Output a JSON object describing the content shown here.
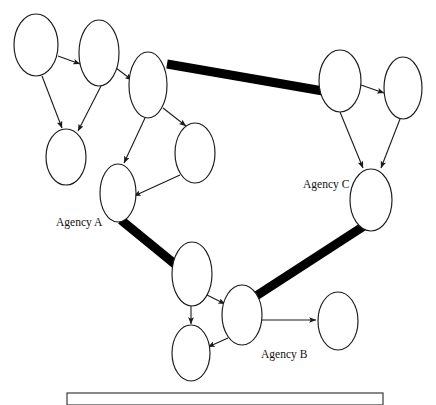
{
  "diagram": {
    "canvas": {
      "width": 436,
      "height": 405,
      "background": "#ffffff"
    },
    "style": {
      "node_fill": "#ffffff",
      "node_stroke": "#1a1a1a",
      "thin_edge_color": "#1a1a1a",
      "thick_edge_color": "#000000",
      "thick_edge_width": 9,
      "thin_edge_width": 1.1,
      "frame_stroke": "#3a3a3a"
    },
    "labels": [
      {
        "id": "label-agency-a",
        "text": "Agency A",
        "x": 56,
        "y": 226
      },
      {
        "id": "label-agency-b",
        "text": "Agency B",
        "x": 261,
        "y": 358
      },
      {
        "id": "label-agency-c",
        "text": "Agency C",
        "x": 303,
        "y": 188
      }
    ],
    "nodes": [
      {
        "id": "n1",
        "name": "node-top-left",
        "cx": 36,
        "cy": 45,
        "rx": 22,
        "ry": 31
      },
      {
        "id": "n2",
        "name": "node-top-second",
        "cx": 99,
        "cy": 53,
        "rx": 20,
        "ry": 33
      },
      {
        "id": "n3",
        "name": "node-top-third",
        "cx": 148,
        "cy": 85,
        "rx": 19,
        "ry": 33
      },
      {
        "id": "n4",
        "name": "node-left-lower",
        "cx": 66,
        "cy": 157,
        "rx": 20,
        "ry": 28
      },
      {
        "id": "n5",
        "name": "node-agency-a",
        "cx": 118,
        "cy": 193,
        "rx": 18,
        "ry": 29
      },
      {
        "id": "n6",
        "name": "node-mid-right",
        "cx": 195,
        "cy": 153,
        "rx": 20,
        "ry": 30
      },
      {
        "id": "n7",
        "name": "node-right-upper",
        "cx": 340,
        "cy": 81,
        "rx": 21,
        "ry": 31
      },
      {
        "id": "n8",
        "name": "node-right-top-far",
        "cx": 403,
        "cy": 88,
        "rx": 19,
        "ry": 31
      },
      {
        "id": "n9",
        "name": "node-agency-c",
        "cx": 371,
        "cy": 200,
        "rx": 21,
        "ry": 31
      },
      {
        "id": "n10",
        "name": "node-lower-mid-upper",
        "cx": 192,
        "cy": 274,
        "rx": 20,
        "ry": 32
      },
      {
        "id": "n11",
        "name": "node-agency-b",
        "cx": 242,
        "cy": 315,
        "rx": 20,
        "ry": 30
      },
      {
        "id": "n12",
        "name": "node-lower-left",
        "cx": 191,
        "cy": 353,
        "rx": 19,
        "ry": 28
      },
      {
        "id": "n13",
        "name": "node-lower-right",
        "cx": 338,
        "cy": 321,
        "rx": 20,
        "ry": 29
      }
    ],
    "thin_edges": [
      {
        "name": "edge-n1-n2",
        "from": "n1",
        "to": "n2",
        "x1": 58,
        "y1": 56,
        "x2": 80,
        "y2": 64
      },
      {
        "name": "edge-n2-n3",
        "from": "n2",
        "to": "n3",
        "x1": 116,
        "y1": 68,
        "x2": 132,
        "y2": 80
      },
      {
        "name": "edge-n1-n4",
        "from": "n1",
        "to": "n4",
        "x1": 42,
        "y1": 76,
        "x2": 62,
        "y2": 128
      },
      {
        "name": "edge-n2-n4",
        "from": "n2",
        "to": "n4",
        "x1": 101,
        "y1": 86,
        "x2": 78,
        "y2": 131
      },
      {
        "name": "edge-n3-n5",
        "from": "n3",
        "to": "n5",
        "x1": 145,
        "y1": 118,
        "x2": 124,
        "y2": 163
      },
      {
        "name": "edge-n3-n6",
        "from": "n3",
        "to": "n6",
        "x1": 163,
        "y1": 108,
        "x2": 186,
        "y2": 126
      },
      {
        "name": "edge-n6-n5",
        "from": "n6",
        "to": "n5",
        "x1": 180,
        "y1": 175,
        "x2": 134,
        "y2": 196
      },
      {
        "name": "edge-n7-n8",
        "from": "n7",
        "to": "n8",
        "x1": 361,
        "y1": 85,
        "x2": 384,
        "y2": 93
      },
      {
        "name": "edge-n7-n9",
        "from": "n7",
        "to": "n9",
        "x1": 340,
        "y1": 112,
        "x2": 363,
        "y2": 168
      },
      {
        "name": "edge-n8-n9",
        "from": "n8",
        "to": "n9",
        "x1": 400,
        "y1": 119,
        "x2": 381,
        "y2": 168
      },
      {
        "name": "edge-n10-n11",
        "from": "n10",
        "to": "n11",
        "x1": 207,
        "y1": 295,
        "x2": 225,
        "y2": 304
      },
      {
        "name": "edge-n10-n12",
        "from": "n10",
        "to": "n12",
        "x1": 191,
        "y1": 306,
        "x2": 191,
        "y2": 324
      },
      {
        "name": "edge-n11-n12",
        "from": "n11",
        "to": "n12",
        "x1": 228,
        "y1": 338,
        "x2": 208,
        "y2": 347
      },
      {
        "name": "edge-n11-n13",
        "from": "n11",
        "to": "n13",
        "x1": 262,
        "y1": 320,
        "x2": 316,
        "y2": 320
      }
    ],
    "thick_edges": [
      {
        "name": "thick-edge-n3-n7",
        "from": "n3",
        "to": "n7",
        "x1": 167,
        "y1": 64,
        "x2": 323,
        "y2": 91
      },
      {
        "name": "thick-edge-n5-n10",
        "from": "n5",
        "to": "n10",
        "x1": 121,
        "y1": 220,
        "x2": 176,
        "y2": 265
      },
      {
        "name": "thick-edge-n11-n9",
        "from": "n11",
        "to": "n9",
        "x1": 256,
        "y1": 296,
        "x2": 364,
        "y2": 226
      }
    ],
    "frame": {
      "name": "bottom-frame",
      "x": 67,
      "y": 393,
      "width": 316,
      "height": 12
    }
  }
}
